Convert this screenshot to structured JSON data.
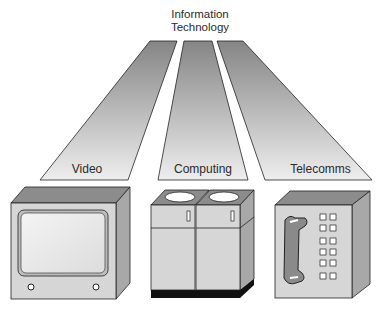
{
  "title": {
    "line1": "Information",
    "line2": "Technology"
  },
  "branches": [
    {
      "id": "video",
      "label": "Video",
      "device": "television-monitor"
    },
    {
      "id": "computing",
      "label": "Computing",
      "device": "computer-cabinets"
    },
    {
      "id": "telecomms",
      "label": "Telecomms",
      "device": "telephone-keypad"
    }
  ],
  "colors": {
    "beam_dark": "#8a8a8a",
    "beam_light": "#ececec",
    "box_front": "#d6d6d6",
    "box_top": "#8c8c8c",
    "box_side": "#a8a8a8",
    "outline": "#222222",
    "screen": "#eeeeee",
    "handset": "#8a8a8a",
    "base": "#111111"
  }
}
